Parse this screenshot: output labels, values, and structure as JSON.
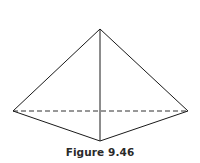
{
  "figure": {
    "caption": "Figure 9.46",
    "vertices": {
      "apex": [
        100,
        29
      ],
      "left": [
        13,
        111
      ],
      "right": [
        188,
        111
      ],
      "front": [
        100,
        141
      ]
    },
    "edges": [
      {
        "from": "apex",
        "to": "left",
        "style": "solid"
      },
      {
        "from": "apex",
        "to": "right",
        "style": "solid"
      },
      {
        "from": "apex",
        "to": "front",
        "style": "solid"
      },
      {
        "from": "left",
        "to": "front",
        "style": "solid"
      },
      {
        "from": "right",
        "to": "front",
        "style": "solid"
      },
      {
        "from": "left",
        "to": "right",
        "style": "dashed"
      }
    ],
    "line_color": "#1a1a1a"
  }
}
